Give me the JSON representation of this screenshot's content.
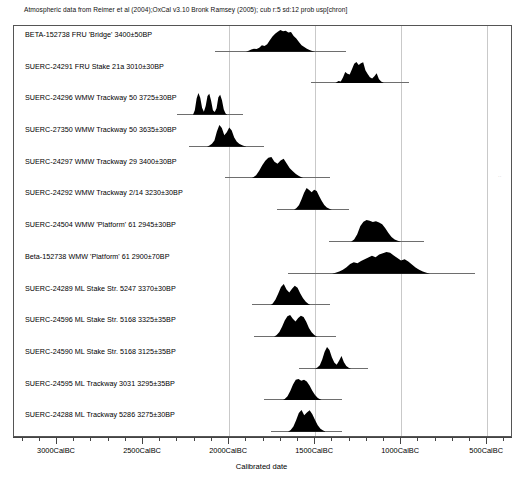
{
  "header": {
    "caption": "Atmospheric data from Reimer et al (2004);OxCal v3.10 Bronk Ramsey (2005); cub r:5 sd:12 prob usp[chron]"
  },
  "axis": {
    "title": "Calibrated date",
    "tick_labels": [
      "3000CalBC",
      "2500CalBC",
      "2000CalBC",
      "1500CalBC",
      "1000CalBC",
      "500CalBC"
    ],
    "tick_values": [
      3000,
      2500,
      2000,
      1500,
      1000,
      500
    ],
    "minor_step": 100,
    "range_left": 3250,
    "range_right": 350,
    "gridlines": [
      2000,
      1500,
      1000,
      500
    ]
  },
  "stray_mark": "··",
  "chart_data": {
    "type": "area",
    "title": "Atmospheric data from Reimer et al (2004);OxCal v3.10 Bronk Ramsey (2005); cub r:5 sd:12 prob usp[chron]",
    "xlabel": "Calibrated date",
    "ylabel": "",
    "xlim": [
      3250,
      350
    ],
    "x_units": "CalBC",
    "grid": true,
    "legend": "none",
    "series": [
      {
        "name": "BETA-152738 FRU 'Bridge'  3400±50BP",
        "lab_code": "BETA-152738",
        "site": "FRU",
        "context": "'Bridge'",
        "bp_age": 3400,
        "bp_error": 50,
        "range_start": 1900,
        "range_end": 1500,
        "peak": 1700,
        "profile": [
          0,
          0.04,
          0.1,
          0.14,
          0.12,
          0.18,
          0.3,
          0.26,
          0.34,
          0.52,
          0.7,
          0.82,
          0.92,
          1.0,
          0.94,
          0.96,
          0.88,
          0.9,
          0.72,
          0.6,
          0.44,
          0.3,
          0.22,
          0.14,
          0.08,
          0.03,
          0
        ]
      },
      {
        "name": "SUERC-24291 FRU Stake 21a  3010±30BP",
        "lab_code": "SUERC-24291",
        "site": "FRU",
        "context": "Stake 21a",
        "bp_age": 3010,
        "bp_error": 30,
        "range_start": 1390,
        "range_end": 1090,
        "peak": 1240,
        "profile": [
          0,
          0.05,
          0.12,
          0.1,
          0.28,
          0.54,
          0.46,
          0.42,
          0.66,
          0.92,
          1.0,
          0.86,
          0.94,
          0.98,
          0.62,
          0.44,
          0.3,
          0.24,
          0.34,
          0.48,
          0.22,
          0.1,
          0.04,
          0
        ]
      },
      {
        "name": "SUERC-24296 WMW Trackway 50  3725±30BP",
        "lab_code": "SUERC-24296",
        "site": "WMW",
        "context": "Trackway 50",
        "bp_age": 3725,
        "bp_error": 30,
        "range_start": 2210,
        "range_end": 2010,
        "peak": 2130,
        "profile": [
          0,
          0.2,
          0.74,
          1.0,
          0.78,
          0.32,
          0.14,
          0.4,
          0.86,
          0.96,
          0.64,
          0.2,
          0.12,
          0.3,
          0.8,
          0.92,
          0.66,
          0.24,
          0.06,
          0
        ]
      },
      {
        "name": "SUERC-27350 WMW Trackway 50  3635±30BP",
        "lab_code": "SUERC-27350",
        "site": "WMW",
        "context": "Trackway 50",
        "bp_age": 3635,
        "bp_error": 30,
        "range_start": 2130,
        "range_end": 1900,
        "peak": 2010,
        "profile": [
          0,
          0.06,
          0.14,
          0.28,
          0.7,
          1.0,
          0.86,
          0.52,
          0.66,
          0.88,
          0.74,
          0.42,
          0.24,
          0.14,
          0.08,
          0.03,
          0
        ]
      },
      {
        "name": "SUERC-24297 WMW Trackway 29  3400±30BP",
        "lab_code": "SUERC-24297",
        "site": "WMW",
        "context": "Trackway 29",
        "bp_age": 3400,
        "bp_error": 30,
        "range_start": 1880,
        "range_end": 1560,
        "peak": 1690,
        "profile": [
          0,
          0.06,
          0.16,
          0.36,
          0.62,
          0.82,
          0.96,
          1.0,
          0.78,
          0.68,
          0.84,
          0.92,
          0.7,
          0.48,
          0.34,
          0.22,
          0.12,
          0.05,
          0
        ]
      },
      {
        "name": "SUERC-24292 WMW Trackway 2/14  3230±30BP",
        "lab_code": "SUERC-24292",
        "site": "WMW",
        "context": "Trackway 2/14",
        "bp_age": 3230,
        "bp_error": 30,
        "range_start": 1620,
        "range_end": 1400,
        "peak": 1510,
        "profile": [
          0,
          0.08,
          0.22,
          0.48,
          0.78,
          1.0,
          0.9,
          0.8,
          0.92,
          0.86,
          0.62,
          0.4,
          0.22,
          0.1,
          0.04,
          0
        ]
      },
      {
        "name": "SUERC-24504 WMW 'Platform' 61  2945±30BP",
        "lab_code": "SUERC-24504",
        "site": "WMW",
        "context": "'Platform' 61",
        "bp_age": 2945,
        "bp_error": 30,
        "range_start": 1290,
        "range_end": 1000,
        "peak": 1150,
        "profile": [
          0,
          0.1,
          0.34,
          0.72,
          0.92,
          1.0,
          0.96,
          0.9,
          0.94,
          0.88,
          0.8,
          0.62,
          0.4,
          0.22,
          0.1,
          0.04,
          0
        ]
      },
      {
        "name": "Beta-152738 WMW 'Platform' 61  2900±70BP",
        "lab_code": "Beta-152738",
        "site": "WMW",
        "context": "'Platform' 61",
        "bp_age": 2900,
        "bp_error": 70,
        "range_start": 1400,
        "range_end": 830,
        "peak": 1080,
        "profile": [
          0,
          0.04,
          0.1,
          0.18,
          0.3,
          0.44,
          0.52,
          0.48,
          0.58,
          0.66,
          0.74,
          0.82,
          0.76,
          0.88,
          0.94,
          1.0,
          0.96,
          0.84,
          0.72,
          0.6,
          0.66,
          0.56,
          0.42,
          0.28,
          0.18,
          0.1,
          0.04,
          0
        ]
      },
      {
        "name": "SUERC-24289 ML Stake Str. 5247  3370±30BP",
        "lab_code": "SUERC-24289",
        "site": "ML",
        "context": "Stake Str. 5247",
        "bp_age": 3370,
        "bp_error": 30,
        "range_start": 1760,
        "range_end": 1520,
        "peak": 1650,
        "profile": [
          0,
          0.1,
          0.28,
          0.56,
          0.86,
          1.0,
          0.74,
          0.6,
          0.78,
          0.92,
          0.82,
          0.56,
          0.34,
          0.18,
          0.08,
          0
        ]
      },
      {
        "name": "SUERC-24596 ML Stake Str. 5168  3325±35BP",
        "lab_code": "SUERC-24596",
        "site": "ML",
        "context": "Stake Str. 5168",
        "bp_age": 3325,
        "bp_error": 35,
        "range_start": 1740,
        "range_end": 1490,
        "peak": 1610,
        "profile": [
          0,
          0.08,
          0.22,
          0.46,
          0.74,
          0.94,
          1.0,
          0.82,
          0.7,
          0.86,
          0.96,
          0.9,
          0.68,
          0.4,
          0.2,
          0.08,
          0
        ]
      },
      {
        "name": "SUERC-24590 ML Stake Str. 5168  3125±35BP",
        "lab_code": "SUERC-24590",
        "site": "ML",
        "context": "Stake Str. 5168",
        "bp_age": 3125,
        "bp_error": 35,
        "range_start": 1500,
        "range_end": 1290,
        "peak": 1410,
        "profile": [
          0,
          0.06,
          0.16,
          0.42,
          0.78,
          1.0,
          0.86,
          0.52,
          0.28,
          0.18,
          0.36,
          0.58,
          0.3,
          0.12,
          0.04,
          0
        ]
      },
      {
        "name": "SUERC-24595 ML Trackway 3031  3295±35BP",
        "lab_code": "SUERC-24595",
        "site": "ML",
        "context": "Trackway 3031",
        "bp_age": 3295,
        "bp_error": 35,
        "range_start": 1690,
        "range_end": 1450,
        "peak": 1570,
        "profile": [
          0,
          0.08,
          0.2,
          0.44,
          0.74,
          0.96,
          1.0,
          0.92,
          0.96,
          0.88,
          0.7,
          0.46,
          0.26,
          0.12,
          0.05,
          0
        ]
      },
      {
        "name": "SUERC-24288 ML Trackway 5286  3275±30BP",
        "lab_code": "SUERC-24288",
        "site": "ML",
        "context": "Trackway 5286",
        "bp_age": 3275,
        "bp_error": 30,
        "range_start": 1660,
        "range_end": 1440,
        "peak": 1545,
        "profile": [
          0,
          0.08,
          0.24,
          0.52,
          0.86,
          1.0,
          0.76,
          0.88,
          0.98,
          0.8,
          0.54,
          0.3,
          0.14,
          0.06,
          0
        ]
      }
    ]
  }
}
